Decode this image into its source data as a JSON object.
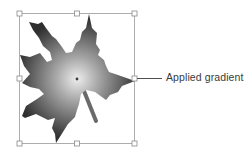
{
  "figure": {
    "callout": {
      "label": "Applied gradient"
    },
    "object": {
      "name": "maple leaf",
      "fill": "radial gradient",
      "gradient_center_color": "#e8e8e8",
      "gradient_edge_color": "#3a3a3a"
    },
    "selection": {
      "stroke_color": "#9a9a9a",
      "handles": 8
    }
  }
}
